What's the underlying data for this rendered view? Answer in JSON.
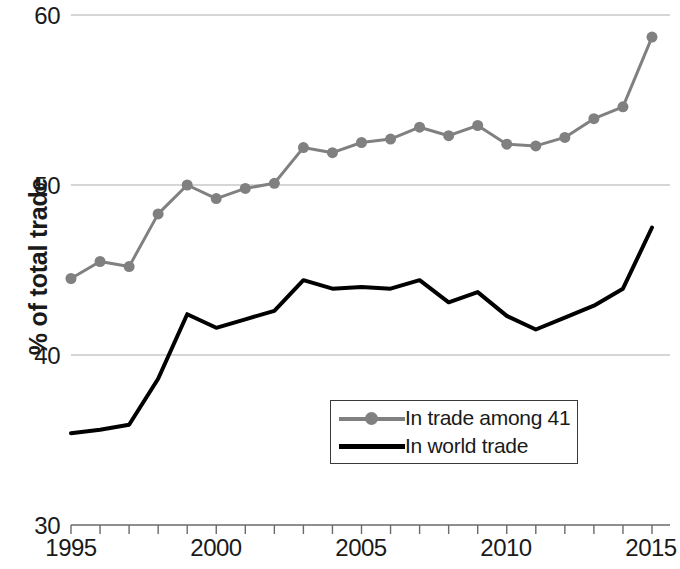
{
  "chart_data": {
    "type": "line",
    "title": "",
    "xlabel": "",
    "ylabel": "% of total trade",
    "xlim": [
      1995,
      2015
    ],
    "ylim": [
      30,
      60
    ],
    "grid": true,
    "grid_axis": "y",
    "legend_position": "bottom-right",
    "x": [
      1995,
      1996,
      1997,
      1998,
      1999,
      2000,
      2001,
      2002,
      2003,
      2004,
      2005,
      2006,
      2007,
      2008,
      2009,
      2010,
      2011,
      2012,
      2013,
      2014,
      2015
    ],
    "y_ticks": [
      30,
      40,
      50,
      60
    ],
    "x_ticks": [
      1995,
      1996,
      1997,
      1998,
      1999,
      2000,
      2001,
      2002,
      2003,
      2004,
      2005,
      2006,
      2007,
      2008,
      2009,
      2010,
      2011,
      2012,
      2013,
      2014,
      2015
    ],
    "x_tick_labels_shown": [
      "1995",
      "2000",
      "2005",
      "2010",
      "2015"
    ],
    "series": [
      {
        "name": "In trade among 41",
        "color": "#808080",
        "marker": "circle",
        "marker_size": 11,
        "line_width": 3,
        "values": [
          44.5,
          45.5,
          45.2,
          48.3,
          50.0,
          49.2,
          49.8,
          50.1,
          52.2,
          51.9,
          52.5,
          52.7,
          53.4,
          52.9,
          53.5,
          52.4,
          52.3,
          52.8,
          53.9,
          54.6,
          58.7
        ]
      },
      {
        "name": "In world trade",
        "color": "#000000",
        "marker": "none",
        "marker_size": 0,
        "line_width": 4,
        "values": [
          35.4,
          35.6,
          35.9,
          38.6,
          42.4,
          41.6,
          42.1,
          42.6,
          44.4,
          43.9,
          44.0,
          43.9,
          44.4,
          43.1,
          43.7,
          42.3,
          41.5,
          42.2,
          42.9,
          43.9,
          47.5
        ]
      }
    ]
  },
  "axis": {
    "y_labels": [
      "60",
      "50",
      "40",
      "30"
    ],
    "y_title": "% of total trade",
    "x_labels": [
      "1995",
      "2000",
      "2005",
      "2010",
      "2015"
    ]
  },
  "legend": {
    "entries": [
      {
        "label": "In trade among 41",
        "color": "#808080",
        "has_marker": true
      },
      {
        "label": "In world trade",
        "color": "#000000",
        "has_marker": false
      }
    ]
  },
  "colors": {
    "series_gray": "#808080",
    "series_black": "#000000",
    "gridline": "#c9c9c9",
    "axis": "#5a5a5a",
    "text": "#1a1a1a",
    "background": "#ffffff"
  }
}
